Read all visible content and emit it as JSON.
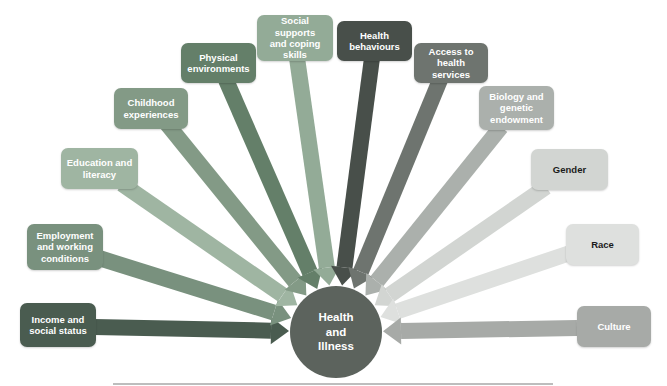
{
  "diagram": {
    "kind": "determinants-of-health-fan",
    "background": "#ffffff",
    "center": {
      "label": "Health and Illness",
      "lines": [
        "Health",
        "and",
        "Illness"
      ],
      "color": "#5c635d",
      "text_color": "#ffffff",
      "cx": 336,
      "cy": 332,
      "r": 46
    },
    "arrow_style": {
      "shaft_width": 16,
      "head_length": 18,
      "head_half_width": 13.5,
      "tip_distance": 47
    },
    "factors": [
      {
        "id": "income-and-social-status",
        "label": "Income and social status",
        "lines": [
          "Income and",
          "social status"
        ],
        "color": "#4a5c50",
        "text_color": "#ffffff",
        "x": 20,
        "y": 303,
        "w": 76,
        "h": 44,
        "tail": [
          94,
          327
        ]
      },
      {
        "id": "employment-and-working-conditions",
        "label": "Employment and working conditions",
        "lines": [
          "Employment",
          "and working",
          "conditions"
        ],
        "color": "#79917e",
        "text_color": "#ffffff",
        "x": 27,
        "y": 224,
        "w": 76,
        "h": 46,
        "tail": [
          99,
          258
        ]
      },
      {
        "id": "education-and-literacy",
        "label": "Education and literacy",
        "lines": [
          "Education and",
          "literacy"
        ],
        "color": "#9fb5a2",
        "text_color": "#ffffff",
        "x": 61,
        "y": 148,
        "w": 77,
        "h": 41,
        "tail": [
          122,
          184
        ]
      },
      {
        "id": "childhood-experiences",
        "label": "Childhood experiences",
        "lines": [
          "Childhood",
          "experiences"
        ],
        "color": "#839a86",
        "text_color": "#ffffff",
        "x": 114,
        "y": 88,
        "w": 74,
        "h": 41,
        "tail": [
          167,
          124
        ]
      },
      {
        "id": "physical-environments",
        "label": "Physical environments",
        "lines": [
          "Physical",
          "environments"
        ],
        "color": "#647f69",
        "text_color": "#ffffff",
        "x": 181,
        "y": 43,
        "w": 75,
        "h": 40,
        "tail": [
          226,
          80
        ]
      },
      {
        "id": "social-supports-and-coping-skills",
        "label": "Social supports and coping skills",
        "lines": [
          "Social supports",
          "and coping",
          "skills"
        ],
        "color": "#93ab97",
        "text_color": "#ffffff",
        "x": 257,
        "y": 15,
        "w": 76,
        "h": 46,
        "tail": [
          297,
          58
        ]
      },
      {
        "id": "health-behaviours",
        "label": "Health behaviours",
        "lines": [
          "Health",
          "behaviours"
        ],
        "color": "#484f4a",
        "text_color": "#ffffff",
        "x": 337,
        "y": 21,
        "w": 75,
        "h": 40,
        "tail": [
          372,
          58
        ]
      },
      {
        "id": "access-to-health-services",
        "label": "Access to health services",
        "lines": [
          "Access to",
          "health services"
        ],
        "color": "#6e746f",
        "text_color": "#ffffff",
        "x": 414,
        "y": 43,
        "w": 74,
        "h": 40,
        "tail": [
          440,
          80
        ]
      },
      {
        "id": "biology-and-genetic-endowment",
        "label": "Biology and genetic endowment",
        "lines": [
          "Biology and",
          "genetic",
          "endowment"
        ],
        "color": "#abb0ac",
        "text_color": "#ffffff",
        "x": 479,
        "y": 86,
        "w": 75,
        "h": 44,
        "tail": [
          501,
          127
        ]
      },
      {
        "id": "gender",
        "label": "Gender",
        "lines": [
          "Gender"
        ],
        "color": "#d2d5d2",
        "text_color": "#1b1b1b",
        "x": 531,
        "y": 149,
        "w": 77,
        "h": 41,
        "tail": [
          546,
          187
        ]
      },
      {
        "id": "race",
        "label": "Race",
        "lines": [
          "Race"
        ],
        "color": "#dee0de",
        "text_color": "#1b1b1b",
        "x": 566,
        "y": 224,
        "w": 73,
        "h": 41,
        "tail": [
          570,
          253
        ]
      },
      {
        "id": "culture",
        "label": "Culture",
        "lines": [
          "Culture"
        ],
        "color": "#a7aaa7",
        "text_color": "#ffffff",
        "x": 577,
        "y": 306,
        "w": 74,
        "h": 41,
        "tail": [
          577,
          328
        ]
      }
    ],
    "bottom_rule": {
      "color": "#bdbdbd",
      "x": 113,
      "y": 383,
      "w": 440
    }
  }
}
